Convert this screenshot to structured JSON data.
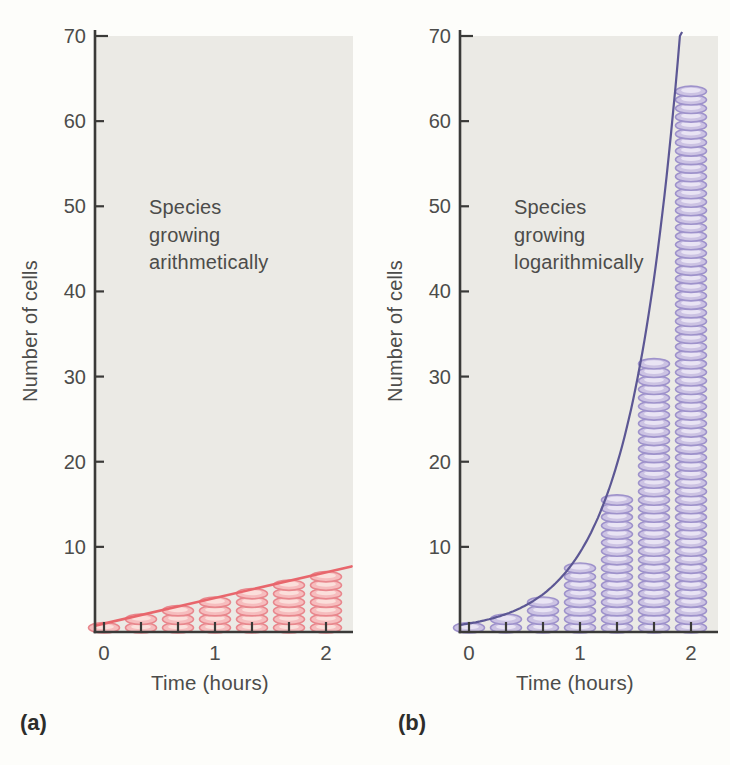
{
  "figure": {
    "background": "#fdfdfa",
    "plot_background": "#ebeae5",
    "axis_color": "#3a3a38",
    "tick_text_color": "#4c4c4a",
    "caption_color": "#2d2d2b"
  },
  "chart_data": [
    {
      "id": "a",
      "caption": "(a)",
      "type": "bar",
      "bar_style": "stacked-cell-pictograms",
      "annotation_lines": [
        "Species",
        "growing",
        "arithmetically"
      ],
      "xlabel": "Time (hours)",
      "ylabel": "Number of cells",
      "ylim": [
        0,
        70
      ],
      "yticks": [
        10,
        20,
        30,
        40,
        50,
        60,
        70
      ],
      "xticks": [
        0,
        1,
        2
      ],
      "x_hours": [
        0,
        0.3333,
        0.6667,
        1,
        1.3333,
        1.6667,
        2
      ],
      "values_cells": [
        1,
        2,
        3,
        4,
        5,
        6,
        7
      ],
      "growth_model": "arithmetic: +3 cells per hour (1 cell per 20-min generation)",
      "trend": {
        "type": "linear",
        "from_hours_cells": [
          -0.08,
          0.75
        ],
        "to_hours_cells": [
          2.23,
          7.7
        ]
      },
      "colors": {
        "cell_fill": "#f6bdbe",
        "cell_stroke": "#e8878d",
        "cell_highlight": "#fbdfdb",
        "trend": "#e8666c"
      }
    },
    {
      "id": "b",
      "caption": "(b)",
      "type": "bar",
      "bar_style": "stacked-cell-pictograms",
      "annotation_lines": [
        "Species",
        "growing",
        "logarithmically"
      ],
      "xlabel": "Time (hours)",
      "ylabel": "Number of cells",
      "ylim": [
        0,
        70
      ],
      "yticks": [
        10,
        20,
        30,
        40,
        50,
        60,
        70
      ],
      "xticks": [
        0,
        1,
        2
      ],
      "x_hours": [
        0,
        0.3333,
        0.6667,
        1,
        1.3333,
        1.6667,
        2
      ],
      "values_cells": [
        1,
        2,
        4,
        8,
        16,
        32,
        64
      ],
      "growth_model": "logarithmic (exponential): doubling every 20 minutes, N = 2^(3t)",
      "trend": {
        "type": "exponential",
        "from_hours_cells": [
          -0.08,
          0.84
        ],
        "exit_hours_cells": [
          1.9,
          70
        ]
      },
      "colors": {
        "cell_fill": "#ccc3e3",
        "cell_stroke": "#9e92cb",
        "cell_highlight": "#e9e4f4",
        "trend": "#5c5794"
      }
    }
  ]
}
